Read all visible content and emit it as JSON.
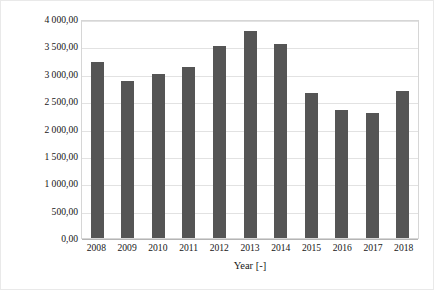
{
  "chart_data": {
    "type": "bar",
    "title": "",
    "xlabel": "Year [-]",
    "ylabel": "GNI per capita, Atlas method [current USD]",
    "categories": [
      "2008",
      "2009",
      "2010",
      "2011",
      "2012",
      "2013",
      "2014",
      "2015",
      "2016",
      "2017",
      "2018"
    ],
    "values": [
      3220,
      2860,
      2990,
      3130,
      3500,
      3790,
      3550,
      2650,
      2330,
      2280,
      2680
    ],
    "ylim": [
      0,
      4000
    ],
    "ytick_values": [
      0,
      500,
      1000,
      1500,
      2000,
      2500,
      3000,
      3500,
      4000
    ],
    "ytick_labels": [
      "0,00",
      "500,00",
      "1 000,00",
      "1 500,00",
      "2 000,00",
      "2 500,00",
      "3 000,00",
      "3 500,00",
      "4 000,00"
    ],
    "grid": "horizontal",
    "legend": "none",
    "series_color": "#555555",
    "gridline_color": "#e2e2e2",
    "plot_border_color": "#d6d6d6"
  }
}
